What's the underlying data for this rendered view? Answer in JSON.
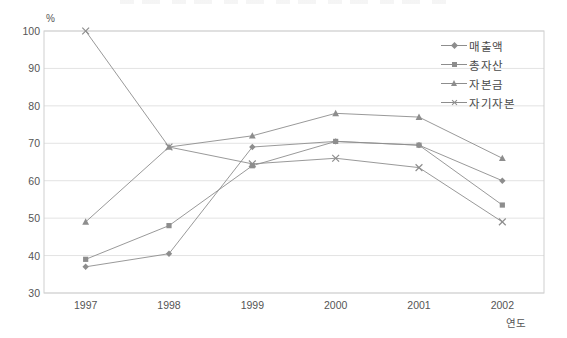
{
  "chart_data": {
    "type": "line",
    "title": "",
    "xlabel": "연도",
    "ylabel": "%",
    "ylim": [
      30,
      100
    ],
    "yticks": [
      30,
      40,
      50,
      60,
      70,
      80,
      90,
      100
    ],
    "grid": true,
    "legend_position": "top-right",
    "categories": [
      "1997",
      "1998",
      "1999",
      "2000",
      "2001",
      "2002"
    ],
    "series": [
      {
        "name": "매출액",
        "marker": "diamond",
        "values": [
          37.0,
          40.5,
          69.0,
          70.5,
          69.5,
          60.0
        ]
      },
      {
        "name": "총자산",
        "marker": "square",
        "values": [
          39.0,
          48.0,
          64.0,
          70.5,
          69.5,
          53.5
        ]
      },
      {
        "name": "자본금",
        "marker": "triangle",
        "values": [
          49.0,
          69.0,
          72.0,
          78.0,
          77.0,
          66.0
        ]
      },
      {
        "name": "자기자본",
        "marker": "cross",
        "values": [
          100.0,
          69.0,
          64.5,
          66.0,
          63.5,
          49.0
        ]
      }
    ],
    "colors": {
      "line": "#8d8d8d",
      "grid": "#e3e3e3",
      "border": "#cfcfcf",
      "text": "#555555"
    }
  },
  "legend": {
    "items": [
      {
        "label": "매출액"
      },
      {
        "label": "총자산"
      },
      {
        "label": "자본금"
      },
      {
        "label": "자기자본"
      }
    ]
  },
  "axes": {
    "y_unit": "%",
    "x_title": "연도",
    "y_tick_labels": [
      "100",
      "90",
      "80",
      "70",
      "60",
      "50",
      "40",
      "30"
    ],
    "x_tick_labels": [
      "1997",
      "1998",
      "1999",
      "2000",
      "2001",
      "2002"
    ]
  }
}
